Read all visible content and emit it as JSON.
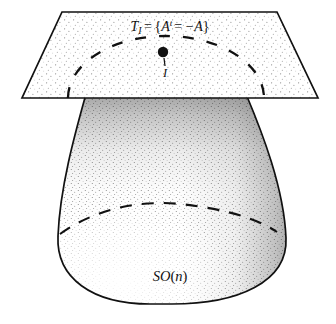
{
  "figure": {
    "caption_title": "Tangent space to SO(n) at the identity",
    "background_color": "#ffffff",
    "ink_color": "#111111",
    "stipple_color": "#8c8c8c",
    "shade_color": "#3a3a3a"
  },
  "labels": {
    "tangent_plane": {
      "text": "T_I = {A^t = −A}",
      "parts": {
        "T": "T",
        "subscript_I": "I",
        "equals": "=",
        "open_brace": "{",
        "A": "A",
        "superscript_t": "t",
        "inner_equals": "=",
        "minus_A": "−A",
        "close_brace": "}"
      },
      "x": 170,
      "y": 28
    },
    "identity_point": {
      "text": "I",
      "x": 164,
      "y": 70,
      "description": "identity element label below the marked dot"
    },
    "group_manifold": {
      "text": "SO(n)",
      "parts": {
        "SO": "SO",
        "open_paren": "(",
        "n": "n",
        "close_paren": ")"
      },
      "x": 170,
      "y": 281
    }
  },
  "shapes": {
    "tangent_plane": {
      "name": "tangent-plane",
      "kind": "trapezoid",
      "corners": [
        [
          62,
          12
        ],
        [
          277,
          12
        ],
        [
          318,
          98
        ],
        [
          22,
          98
        ]
      ],
      "fill": "stipple-light",
      "stroke": "#111111",
      "stroke_width": 1.6
    },
    "identity_dot": {
      "name": "identity-point-dot",
      "kind": "circle",
      "cx": 163,
      "cy": 52,
      "r": 5.2,
      "fill": "#111111"
    },
    "plane_dashed_arc": {
      "name": "plane-intersection-arc",
      "kind": "dashed-arc",
      "description": "dashed elliptical arc on the tangent plane, opening downward, representing the projected silhouette of SO(n)",
      "cx": 166,
      "cy": 100,
      "rx": 98,
      "ry": 62,
      "dash": "11 13"
    },
    "manifold_blob": {
      "name": "so-n-manifold-blob",
      "kind": "dome",
      "description": "bell / dome shaped blob hanging below the plane, widest near its lower third, rounded bottom",
      "top_left_x": 86,
      "top_right_x": 246,
      "top_y": 96,
      "widest_left_x": 58,
      "widest_right_x": 286,
      "widest_y": 248,
      "bottom_y": 303,
      "stroke": "#111111",
      "stroke_width": 1.7
    },
    "blob_dashed_arc": {
      "name": "manifold-equator-arc",
      "kind": "dashed-arc",
      "description": "dashed curve arcing across the blob indicating a cross-section / hidden contour",
      "left_point": [
        60,
        234
      ],
      "apex": [
        178,
        204
      ],
      "right_point": [
        277,
        232
      ],
      "dash": "12 10"
    }
  },
  "shading": {
    "description": "hand-stipple engraving style: light uniform dot texture on the tangent plane, and graded dot shading on the blob that is darkest at the top and along the right flank",
    "plane_dot_spacing": 9,
    "blob_dark_regions": [
      "top",
      "upper-right",
      "right-flank"
    ],
    "blob_light_regions": [
      "lower-center",
      "bottom-left"
    ]
  }
}
